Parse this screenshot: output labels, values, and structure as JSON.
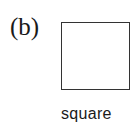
{
  "figure": {
    "panel_label": "(b)",
    "shape": "square",
    "caption": "square",
    "stroke_color": "#333333"
  }
}
